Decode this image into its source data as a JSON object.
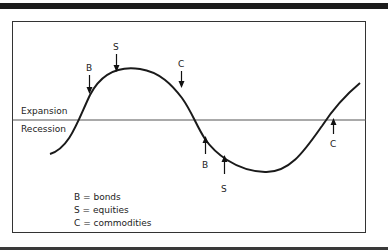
{
  "diagram": {
    "zones": {
      "upper": "Expansion",
      "lower": "Recession"
    },
    "markers": [
      {
        "letter": "B",
        "position": "expansion-early",
        "arrow": "down"
      },
      {
        "letter": "S",
        "position": "near-peak",
        "arrow": "down"
      },
      {
        "letter": "C",
        "position": "after-peak",
        "arrow": "down"
      },
      {
        "letter": "B",
        "position": "recession-early",
        "arrow": "up"
      },
      {
        "letter": "S",
        "position": "near-trough",
        "arrow": "up"
      },
      {
        "letter": "C",
        "position": "recovery",
        "arrow": "up"
      }
    ],
    "legend": [
      "B = bonds",
      "S = equities",
      "C = commodities"
    ]
  }
}
